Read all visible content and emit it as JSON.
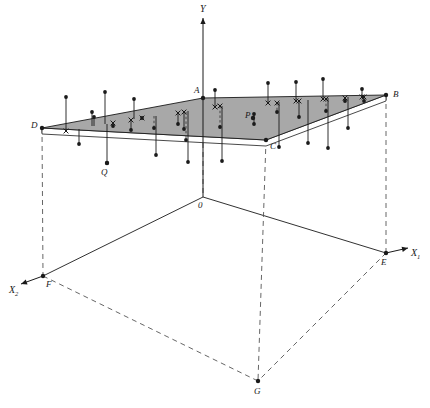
{
  "figure": {
    "background": "#ffffff",
    "plane_fill": "#a8a8a8",
    "stroke": "#1a1a1a",
    "dashed_stroke": "#555555"
  },
  "axes": {
    "y": {
      "name": "Y",
      "label": "Y",
      "x": 203,
      "y_top": 18,
      "y_bottom": 197,
      "arrow": "up"
    },
    "x1": {
      "name": "X1",
      "label": "X",
      "sub": "1",
      "label_x": 411,
      "label_y": 256,
      "arrow": "right"
    },
    "x2": {
      "name": "X2",
      "label": "X",
      "sub": "2",
      "label_x": 9,
      "label_y": 293,
      "arrow": "left-down"
    }
  },
  "points": {
    "O": {
      "label": "0",
      "x": 203,
      "y": 197,
      "lx": 198,
      "ly": 208
    },
    "A": {
      "label": "A",
      "x": 203,
      "y": 98,
      "lx": 194,
      "ly": 93
    },
    "B": {
      "label": "B",
      "x": 386,
      "y": 95,
      "lx": 393,
      "ly": 97
    },
    "C": {
      "label": "C",
      "x": 266,
      "y": 140,
      "lx": 270,
      "ly": 149
    },
    "D": {
      "label": "D",
      "x": 42,
      "y": 128,
      "lx": 31,
      "ly": 128
    },
    "E": {
      "label": "E",
      "x": 386,
      "y": 253,
      "lx": 381,
      "ly": 265
    },
    "F": {
      "label": "F",
      "x": 43,
      "y": 276,
      "lx": 46,
      "ly": 287
    },
    "G": {
      "label": "G",
      "x": 258,
      "y": 381,
      "lx": 254,
      "ly": 394
    },
    "P": {
      "label": "P",
      "x": 253,
      "y": 118,
      "lx": 245,
      "ly": 118
    },
    "Q": {
      "label": "Q",
      "x": 107,
      "y": 163,
      "lx": 101,
      "ly": 175
    }
  },
  "plane": {
    "name": "regression-plane-ABCD",
    "vertices": [
      {
        "id": "D",
        "x": 42,
        "y": 128
      },
      {
        "id": "A",
        "x": 203,
        "y": 98
      },
      {
        "id": "B",
        "x": 386,
        "y": 95
      },
      {
        "id": "C",
        "x": 266,
        "y": 140
      }
    ],
    "front_edge_offset": 6,
    "fill": "#a8a8a8"
  },
  "chart_data": {
    "type": "scatter",
    "xlabel": "X1",
    "ylabel": "Y",
    "zlabel": "X2",
    "legend": [],
    "grid": false,
    "observations": [
      {
        "sx": 66,
        "py": 131,
        "dy": 97,
        "res": "above",
        "style": "solid",
        "cross": true
      },
      {
        "sx": 79,
        "py": 129,
        "dy": 144,
        "res": "below",
        "style": "solid",
        "cross": false
      },
      {
        "sx": 92,
        "py": 126,
        "dy": 112,
        "res": "above",
        "style": "solid",
        "cross": false
      },
      {
        "sx": 94,
        "py": 126,
        "dy": 117,
        "res": "above",
        "style": "solid",
        "cross": false
      },
      {
        "sx": 105,
        "py": 124,
        "dy": 92,
        "res": "above",
        "style": "solid",
        "cross": false
      },
      {
        "sx": 107,
        "py": 124,
        "dy": 163,
        "res": "below",
        "style": "solid",
        "cross": false
      },
      {
        "sx": 113,
        "py": 123,
        "dy": 126,
        "res": "above",
        "style": "dashed",
        "cross": true
      },
      {
        "sx": 131,
        "py": 120,
        "dy": 130,
        "res": "above",
        "style": "solid",
        "cross": true
      },
      {
        "sx": 134,
        "py": 119,
        "dy": 99,
        "res": "above",
        "style": "solid",
        "cross": false
      },
      {
        "sx": 142,
        "py": 118,
        "dy": 118,
        "res": "above",
        "style": "solid",
        "cross": true
      },
      {
        "sx": 154,
        "py": 116,
        "dy": 128,
        "res": "below",
        "style": "dashed",
        "cross": false
      },
      {
        "sx": 156,
        "py": 116,
        "dy": 155,
        "res": "below",
        "style": "solid",
        "cross": false
      },
      {
        "sx": 178,
        "py": 113,
        "dy": 124,
        "res": "above",
        "style": "solid",
        "cross": true
      },
      {
        "sx": 184,
        "py": 112,
        "dy": 129,
        "res": "above",
        "style": "solid",
        "cross": true
      },
      {
        "sx": 186,
        "py": 112,
        "dy": 140,
        "res": "below",
        "style": "dashed",
        "cross": false
      },
      {
        "sx": 188,
        "py": 111,
        "dy": 162,
        "res": "below",
        "style": "solid",
        "cross": false
      },
      {
        "sx": 215,
        "py": 107,
        "dy": 90,
        "res": "above",
        "style": "solid",
        "cross": true
      },
      {
        "sx": 220,
        "py": 106,
        "dy": 127,
        "res": "below",
        "style": "dashed",
        "cross": true
      },
      {
        "sx": 222,
        "py": 106,
        "dy": 161,
        "res": "below",
        "style": "solid",
        "cross": false
      },
      {
        "sx": 254,
        "py": 118,
        "dy": 114,
        "res": "above",
        "style": "solid",
        "cross": false
      },
      {
        "sx": 254,
        "py": 118,
        "dy": 124,
        "res": "below",
        "style": "solid",
        "cross": false
      },
      {
        "sx": 268,
        "py": 103,
        "dy": 83,
        "res": "above",
        "style": "solid",
        "cross": true
      },
      {
        "sx": 277,
        "py": 103,
        "dy": 112,
        "res": "below",
        "style": "dashed",
        "cross": true
      },
      {
        "sx": 279,
        "py": 102,
        "dy": 147,
        "res": "below",
        "style": "solid",
        "cross": false
      },
      {
        "sx": 296,
        "py": 101,
        "dy": 82,
        "res": "above",
        "style": "solid",
        "cross": true
      },
      {
        "sx": 299,
        "py": 101,
        "dy": 117,
        "res": "below",
        "style": "solid",
        "cross": true
      },
      {
        "sx": 308,
        "py": 100,
        "dy": 143,
        "res": "below",
        "style": "solid",
        "cross": false
      },
      {
        "sx": 323,
        "py": 99,
        "dy": 79,
        "res": "above",
        "style": "solid",
        "cross": true
      },
      {
        "sx": 326,
        "py": 99,
        "dy": 111,
        "res": "below",
        "style": "dashed",
        "cross": true
      },
      {
        "sx": 328,
        "py": 98,
        "dy": 148,
        "res": "below",
        "style": "solid",
        "cross": false
      },
      {
        "sx": 345,
        "py": 98,
        "dy": 101,
        "res": "above",
        "style": "solid",
        "cross": true
      },
      {
        "sx": 348,
        "py": 97,
        "dy": 128,
        "res": "below",
        "style": "solid",
        "cross": false
      },
      {
        "sx": 362,
        "py": 97,
        "dy": 89,
        "res": "above",
        "style": "solid",
        "cross": true
      },
      {
        "sx": 364,
        "py": 97,
        "dy": 101,
        "res": "below",
        "style": "dashed",
        "cross": true
      }
    ],
    "n_observations": 34
  },
  "dropline_pairs": [
    {
      "from": "D",
      "to": "F",
      "style": "dashed"
    },
    {
      "from": "B",
      "to": "E",
      "style": "dashed"
    },
    {
      "from": "C",
      "to": "G",
      "style": "dashed"
    },
    {
      "from": "A",
      "to": "O",
      "style": "dashed"
    }
  ],
  "base_edges": [
    {
      "from": "O",
      "to": "E",
      "style": "solid"
    },
    {
      "from": "O",
      "to": "F",
      "style": "solid"
    },
    {
      "from": "F",
      "to": "G",
      "style": "dashed"
    },
    {
      "from": "E",
      "to": "G",
      "style": "dashed"
    }
  ]
}
